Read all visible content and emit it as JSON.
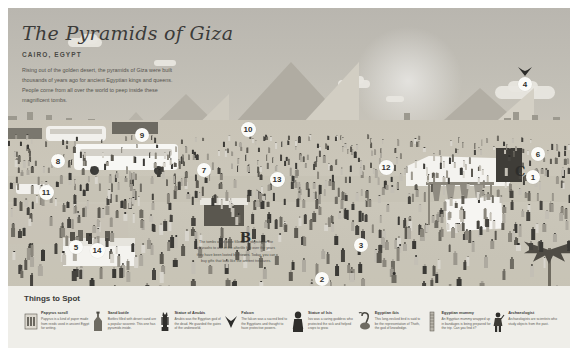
{
  "poster": {
    "title": "The Pyramids of Giza",
    "subtitle": "CAIRO, EGYPT",
    "blurb": "Rising out of the golden desert, the pyramids of Giza were built thousands of years ago for ancient Egyptian kings and queens. People come from all over the world to peep inside these magnificent tombs.",
    "caption": "The tombs were once filled with objects for the pharaohs to use in the afterlife but over the years they have been looted by thieves. Today, you can buy gifts that look like the ancient treasures.",
    "colors": {
      "sky": "#bab7b0",
      "sand": "#c9c4b7",
      "pyramid": "#b3afa5",
      "pyramid_lit": "#d6d2c7",
      "marker_bg": "#fbfbf8",
      "marker_text": "#2f2f2d",
      "legend_bg": "#efeee9"
    }
  },
  "markers": [
    {
      "label": "1",
      "x": 525,
      "y": 169
    },
    {
      "label": "2",
      "x": 314,
      "y": 271
    },
    {
      "label": "3",
      "x": 353,
      "y": 237
    },
    {
      "label": "4",
      "x": 517,
      "y": 76
    },
    {
      "label": "5",
      "x": 68,
      "y": 239
    },
    {
      "label": "6",
      "x": 530,
      "y": 146
    },
    {
      "label": "7",
      "x": 196,
      "y": 162
    },
    {
      "label": "8",
      "x": 50,
      "y": 153
    },
    {
      "label": "9",
      "x": 134,
      "y": 127
    },
    {
      "label": "10",
      "x": 240,
      "y": 121
    },
    {
      "label": "11",
      "x": 38,
      "y": 184
    },
    {
      "label": "12",
      "x": 378,
      "y": 159
    },
    {
      "label": "13",
      "x": 269,
      "y": 171
    },
    {
      "label": "14",
      "x": 89,
      "y": 242
    }
  ],
  "letter_markers": [
    {
      "label": "B",
      "x": 232,
      "y": 222
    },
    {
      "label": "C",
      "x": 507,
      "y": 156
    }
  ],
  "legend": {
    "title": "Things to Spot",
    "items": [
      {
        "icon": "papyrus-scroll-icon",
        "name": "Papyrus scroll",
        "desc": "Papyrus is a kind of paper made from reeds used in ancient Egypt for writing."
      },
      {
        "icon": "sand-bottle-icon",
        "name": "Sand bottle",
        "desc": "Bottles filled with desert sand are a popular souvenir. This one has pyramids inside."
      },
      {
        "icon": "statue-of-anubis-icon",
        "name": "Statue of Anubis",
        "desc": "Anubis was the Egyptian god of the dead. He guarded the gates of the underworld."
      },
      {
        "icon": "falcon-icon",
        "name": "Falcon",
        "desc": "The falcon was a sacred bird to the Egyptians and thought to have protective powers."
      },
      {
        "icon": "statue-of-isis-icon",
        "name": "Statue of Isis",
        "desc": "Isis was a caring goddess who protected the sick and helped crops to grow."
      },
      {
        "icon": "egyptian-ibis-icon",
        "name": "Egyptian ibis",
        "desc": "This long-necked bird is said to be the representation of Thoth, the god of knowledge."
      },
      {
        "icon": "egyptian-mummy-icon",
        "name": "Egyptian mummy",
        "desc": "An Egyptian mummy wrapped up in bandages is being prepared for the trip. Can you find it?"
      },
      {
        "icon": "archaeologist-icon",
        "name": "Archaeologist",
        "desc": "Archaeologists are scientists who study objects from the past."
      }
    ]
  }
}
